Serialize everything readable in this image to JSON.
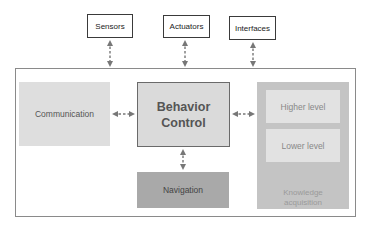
{
  "diagram": {
    "external": {
      "sensors": "Sensors",
      "actuators": "Actuators",
      "interfaces": "Interfaces"
    },
    "modules": {
      "communication": "Communication",
      "behavior_control_line1": "Behavior",
      "behavior_control_line2": "Control",
      "navigation": "Navigation",
      "knowledge": {
        "higher": "Higher level",
        "lower": "Lower level",
        "label_line1": "Knowledge",
        "label_line2": "acquisition"
      }
    },
    "connections": [
      {
        "from": "Sensors",
        "to": "System",
        "style": "dashed-bidirectional"
      },
      {
        "from": "Actuators",
        "to": "System",
        "style": "dashed-bidirectional"
      },
      {
        "from": "Interfaces",
        "to": "System",
        "style": "dashed-bidirectional"
      },
      {
        "from": "Communication",
        "to": "Behavior Control",
        "style": "dashed-bidirectional"
      },
      {
        "from": "Behavior Control",
        "to": "Knowledge acquisition",
        "style": "dashed-bidirectional"
      },
      {
        "from": "Behavior Control",
        "to": "Navigation",
        "style": "dashed-bidirectional"
      }
    ],
    "colors": {
      "arrow": "#777777",
      "communication": "#dedede",
      "behavior": "#dadada",
      "navigation": "#a9a9a9",
      "knowledge": "#c4c4c4",
      "level": "#e2e2e2"
    }
  }
}
